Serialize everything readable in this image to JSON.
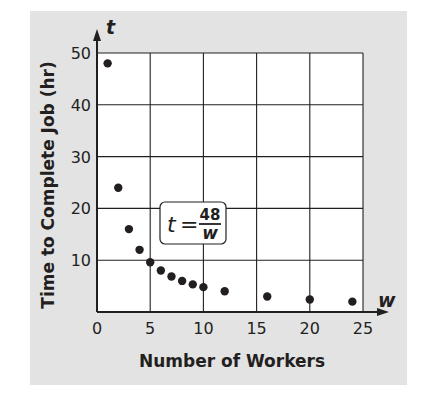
{
  "chart_data": {
    "type": "scatter",
    "title": "",
    "xlabel": "Number of Workers",
    "ylabel": "Time to Complete Job (hr)",
    "x_axis_var": "w",
    "y_axis_var": "t",
    "xlim": [
      0,
      25
    ],
    "ylim": [
      0,
      50
    ],
    "xticks": [
      0,
      5,
      10,
      15,
      20,
      25
    ],
    "yticks": [
      10,
      20,
      30,
      40,
      50
    ],
    "grid": true,
    "annotation": {
      "lhs": "t",
      "equals": "=",
      "numerator": "48",
      "denominator": "w"
    },
    "series": [
      {
        "name": "t = 48/w",
        "x": [
          1,
          2,
          3,
          4,
          5,
          6,
          7,
          8,
          9,
          10,
          12,
          16,
          20,
          24
        ],
        "y": [
          48,
          24,
          16,
          12,
          9.6,
          8,
          6.86,
          6,
          5.33,
          4.8,
          4,
          3,
          2.4,
          2
        ]
      }
    ]
  },
  "colors": {
    "panel": "#e3e3e3",
    "plot_bg": "#ffffff",
    "ink": "#231f20"
  }
}
